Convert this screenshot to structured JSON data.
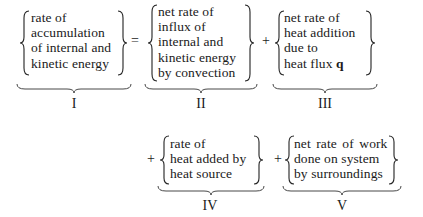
{
  "equation": {
    "terms": [
      {
        "id": "I",
        "label": "I",
        "lines": [
          "rate of",
          "accumulation",
          "of internal and",
          "kinetic energy"
        ]
      },
      {
        "id": "II",
        "label": "II",
        "lines": [
          "net rate of",
          "influx of",
          "internal and",
          "kinetic energy",
          "by convection"
        ]
      },
      {
        "id": "III",
        "label": "III",
        "lines": [
          "net rate of",
          "heat addition",
          "due to",
          "heat flux"
        ],
        "bold_symbol": "q"
      },
      {
        "id": "IV",
        "label": "IV",
        "lines": [
          "rate of",
          "heat added by",
          "heat source"
        ]
      },
      {
        "id": "V",
        "label": "V",
        "lines": [
          "net rate of work",
          "done on system",
          "by surroundings"
        ]
      }
    ],
    "operators": [
      "=",
      "+",
      "+",
      "+"
    ]
  }
}
